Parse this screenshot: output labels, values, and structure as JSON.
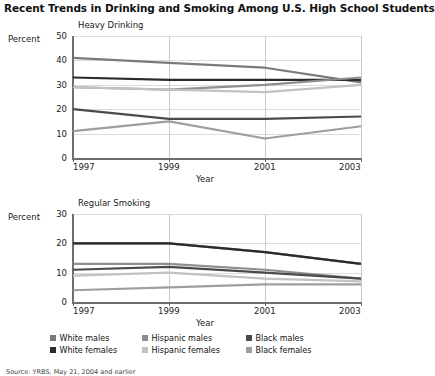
{
  "title": "Recent Trends in Drinking and Smoking Among U.S. High School Students",
  "source": "Source: YRBS, May 21, 2004 and earlier",
  "axis": {
    "percent_label": "Percent",
    "year_label": "Year"
  },
  "legend": {
    "items": [
      {
        "label": "White males",
        "color": "#7a7a7a",
        "key": "white_males"
      },
      {
        "label": "Hispanic males",
        "color": "#8e8e8e",
        "key": "hispanic_males"
      },
      {
        "label": "Black males",
        "color": "#4a4a4a",
        "key": "black_males"
      },
      {
        "label": "White females",
        "color": "#2b2b2b",
        "key": "white_females"
      },
      {
        "label": "Hispanic females",
        "color": "#c2c2c2",
        "key": "hispanic_females"
      },
      {
        "label": "Black females",
        "color": "#9e9e9e",
        "key": "black_females"
      }
    ]
  },
  "chart_data": [
    {
      "type": "line",
      "title": "Heavy Drinking",
      "xlabel": "Year",
      "ylabel": "Percent",
      "x": [
        1997,
        1999,
        2001,
        2003
      ],
      "xlim": [
        1997,
        2003
      ],
      "ylim": [
        0,
        50
      ],
      "yticks": [
        0,
        10,
        20,
        30,
        40,
        50
      ],
      "xticks": [
        1997,
        1999,
        2001,
        2003
      ],
      "grid": true,
      "legend_position": "bottom",
      "series": [
        {
          "name": "White males",
          "color": "#7a7a7a",
          "values": [
            41,
            39,
            37,
            31
          ]
        },
        {
          "name": "White females",
          "color": "#2b2b2b",
          "values": [
            33,
            32,
            32,
            32
          ]
        },
        {
          "name": "Hispanic males",
          "color": "#8e8e8e",
          "values": [
            29,
            28,
            30,
            33
          ]
        },
        {
          "name": "Hispanic females",
          "color": "#c2c2c2",
          "values": [
            29,
            28,
            27,
            30
          ]
        },
        {
          "name": "Black males",
          "color": "#4a4a4a",
          "values": [
            20,
            16,
            16,
            17
          ]
        },
        {
          "name": "Black females",
          "color": "#9e9e9e",
          "values": [
            11,
            15,
            8,
            13
          ]
        }
      ]
    },
    {
      "type": "line",
      "title": "Regular Smoking",
      "xlabel": "Year",
      "ylabel": "Percent",
      "x": [
        1997,
        1999,
        2001,
        2003
      ],
      "xlim": [
        1997,
        2003
      ],
      "ylim": [
        0,
        30
      ],
      "yticks": [
        0,
        10,
        20,
        30
      ],
      "xticks": [
        1997,
        1999,
        2001,
        2003
      ],
      "grid": true,
      "legend_position": "bottom",
      "series": [
        {
          "name": "White males",
          "color": "#7a7a7a",
          "values": [
            20,
            20,
            17,
            13
          ]
        },
        {
          "name": "White females",
          "color": "#2b2b2b",
          "values": [
            20,
            20,
            17,
            13
          ]
        },
        {
          "name": "Hispanic males",
          "color": "#8e8e8e",
          "values": [
            13,
            13,
            11,
            8
          ]
        },
        {
          "name": "Black males",
          "color": "#4a4a4a",
          "values": [
            11,
            12,
            10,
            8
          ]
        },
        {
          "name": "Hispanic females",
          "color": "#c2c2c2",
          "values": [
            9,
            10,
            8,
            7
          ]
        },
        {
          "name": "Black females",
          "color": "#9e9e9e",
          "values": [
            4,
            5,
            6,
            6
          ]
        }
      ]
    }
  ]
}
